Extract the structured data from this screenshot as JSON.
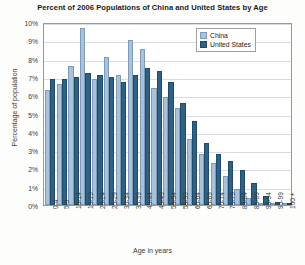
{
  "chart_data": {
    "type": "bar",
    "title": "Percent of 2006 Populations of China and United States by Age",
    "xlabel": "Age in years",
    "ylabel": "Percentage of population",
    "ylim": [
      0,
      10
    ],
    "ytick_labels": [
      "10%",
      "9%",
      "8%",
      "7%",
      "6%",
      "5%",
      "4%",
      "3%",
      "2%",
      "1%",
      "0%"
    ],
    "ytick_values": [
      10,
      9,
      8,
      7,
      6,
      5,
      4,
      3,
      2,
      1,
      0
    ],
    "grid": true,
    "legend_position": "top-right",
    "categories": [
      "0-4",
      "5-9",
      "10-14",
      "15-19",
      "20-24",
      "25-29",
      "30-34",
      "35-39",
      "40-44",
      "45-49",
      "50-54",
      "55-59",
      "60-64",
      "65-69",
      "70-74",
      "75-79",
      "80-84",
      "85-89",
      "90-94",
      "95-99",
      "100 +"
    ],
    "series": [
      {
        "name": "China",
        "color": "#a9c2d9",
        "values": [
          6.3,
          6.6,
          7.6,
          9.7,
          6.9,
          8.1,
          7.1,
          9.0,
          8.5,
          6.4,
          5.9,
          5.3,
          3.6,
          2.8,
          2.3,
          1.6,
          0.9,
          0.4,
          0.1,
          0.03,
          0.01
        ]
      },
      {
        "name": "United States",
        "color": "#2f6185",
        "values": [
          6.9,
          6.9,
          7.0,
          7.2,
          7.1,
          7.0,
          6.7,
          7.1,
          7.5,
          7.3,
          6.7,
          5.6,
          4.6,
          3.4,
          2.8,
          2.4,
          1.9,
          1.2,
          0.5,
          0.15,
          0.03
        ]
      }
    ]
  }
}
